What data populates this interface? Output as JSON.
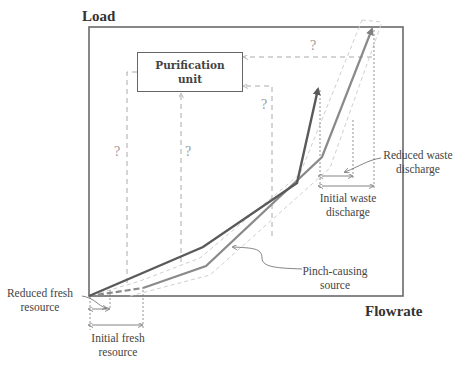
{
  "axes": {
    "y_label": "Load",
    "x_label": "Flowrate"
  },
  "purification_unit": {
    "line1": "Purification",
    "line2": "unit"
  },
  "question_marks": [
    "?",
    "?",
    "?",
    "?"
  ],
  "annotations": {
    "reduced_fresh": {
      "line1": "Reduced fresh",
      "line2": "resource"
    },
    "initial_fresh": {
      "line1": "Initial  fresh",
      "line2": "resource"
    },
    "reduced_waste": {
      "line1": "Reduced waste",
      "line2": "discharge"
    },
    "initial_waste": {
      "line1": "Initial  waste",
      "line2": "discharge"
    },
    "pinch_source": {
      "line1": "Pinch-causing",
      "line2": "source"
    }
  },
  "colors": {
    "sink_curve": "#5a5a5a",
    "source_curve": "#8a8a8a",
    "envelope": "#c8c8c8",
    "dashed_link": "#aaaaaa",
    "frame": "#666666"
  }
}
